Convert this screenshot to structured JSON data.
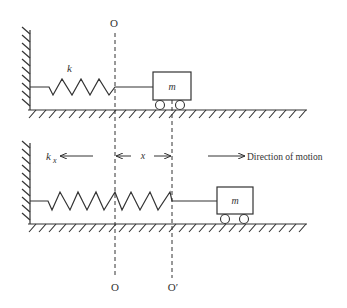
{
  "figure": {
    "type": "spring-mass system diagram",
    "colors": {
      "stroke": "#333333",
      "background": "#ffffff"
    },
    "top_panel": {
      "origin_label": "O",
      "spring_label": "k",
      "mass_label": "m"
    },
    "bottom_panel": {
      "force_label": "k",
      "force_subscript": "x",
      "displacement_label": "x",
      "direction_label": "Direction of motion",
      "mass_label": "m",
      "origin_label_bottom": "O",
      "displaced_origin_label": "O′"
    }
  }
}
